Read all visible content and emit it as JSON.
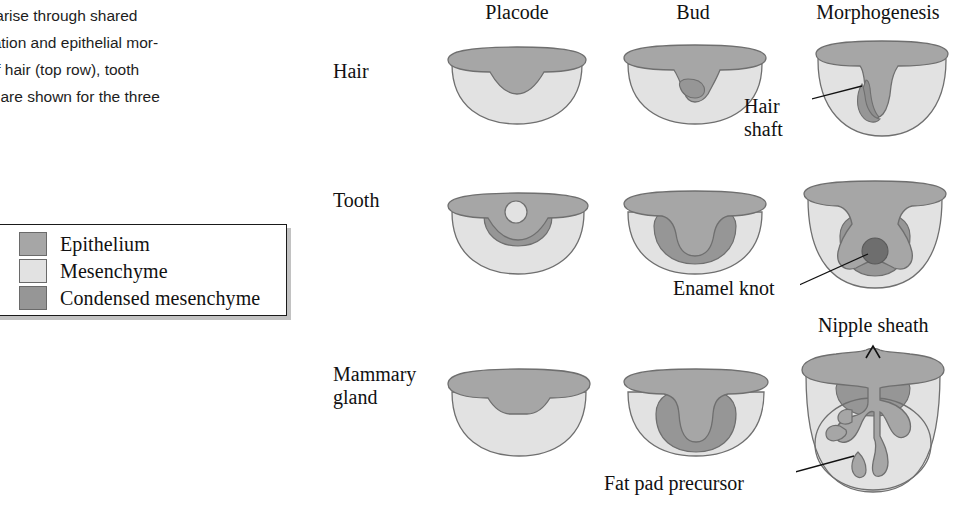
{
  "caption": {
    "lines": [
      "ges arise through shared",
      "sification and epithelial mor-",
      "na of hair (top row), tooth",
      "row) are shown for the three",
      ")"
    ]
  },
  "legend": {
    "items": [
      {
        "label": "Epithelium",
        "color": "#a6a6a6"
      },
      {
        "label": "Mesenchyme",
        "color": "#e2e2e2"
      },
      {
        "label": "Condensed mesenchyme",
        "color": "#969696"
      }
    ]
  },
  "columns": [
    {
      "label": "Placode"
    },
    {
      "label": "Bud"
    },
    {
      "label": "Morphogenesis"
    }
  ],
  "rows": [
    {
      "label": "Hair"
    },
    {
      "label": "Tooth"
    },
    {
      "label": "Mammary\ngland"
    }
  ],
  "annotations": [
    {
      "label": "Hair\nshaft"
    },
    {
      "label": "Enamel knot"
    },
    {
      "label": "Nipple sheath"
    },
    {
      "label": "Fat pad precursor"
    }
  ],
  "colors": {
    "epithelium": "#a6a6a6",
    "mesenchyme": "#e2e2e2",
    "condensed_mesenchyme": "#969696",
    "knot": "#6e6e6e",
    "outline": "#6f6f6f",
    "text": "#111111",
    "background": "#ffffff"
  }
}
